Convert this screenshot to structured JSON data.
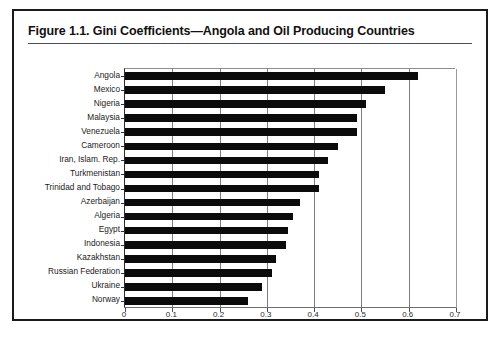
{
  "figure": {
    "title": "Figure 1.1.  Gini Coefficients—Angola and Oil Producing Countries"
  },
  "chart_data": {
    "type": "bar",
    "orientation": "horizontal",
    "title": "Figure 1.1.  Gini Coefficients—Angola and Oil Producing Countries",
    "xlabel": "",
    "ylabel": "",
    "xlim": [
      0,
      0.7
    ],
    "xticks": [
      "0",
      "0.1",
      "0.2",
      "0.3",
      "0.4",
      "0.5",
      "0.6",
      "0.7"
    ],
    "xtick_values": [
      0,
      0.1,
      0.2,
      0.3,
      0.4,
      0.5,
      0.6,
      0.7
    ],
    "grid": "vertical",
    "legend": "none",
    "bar_color": "#0b0b0b",
    "categories": [
      "Angola",
      "Mexico",
      "Nigeria",
      "Malaysia",
      "Venezuela",
      "Cameroon",
      "Iran, Islam. Rep.",
      "Turkmenistan",
      "Trinidad and Tobago",
      "Azerbaijan",
      "Algeria",
      "Egypt",
      "Indonesia",
      "Kazakhstan",
      "Russian Federation",
      "Ukraine",
      "Norway"
    ],
    "values": [
      0.62,
      0.55,
      0.51,
      0.49,
      0.49,
      0.45,
      0.43,
      0.41,
      0.41,
      0.37,
      0.355,
      0.345,
      0.34,
      0.32,
      0.31,
      0.29,
      0.26
    ]
  }
}
